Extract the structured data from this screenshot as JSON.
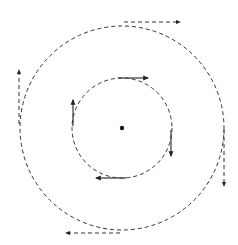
{
  "diagram": {
    "type": "concentric-circular-motion",
    "center": {
      "x": 122,
      "y": 128
    },
    "stroke_color": "#222222",
    "background": "#ffffff",
    "inner_circle": {
      "radius": 50,
      "style": "dashed"
    },
    "outer_circle": {
      "radius": 102,
      "style": "dashed"
    },
    "inner_arrows": [
      {
        "name": "top",
        "direction": "right",
        "style": "solid"
      },
      {
        "name": "right",
        "direction": "down",
        "style": "solid"
      },
      {
        "name": "bottom",
        "direction": "left",
        "style": "solid"
      },
      {
        "name": "left",
        "direction": "up",
        "style": "solid"
      }
    ],
    "outer_arrows": [
      {
        "name": "top",
        "direction": "right",
        "style": "dashed"
      },
      {
        "name": "right",
        "direction": "down",
        "style": "dashed"
      },
      {
        "name": "bottom",
        "direction": "left",
        "style": "dashed"
      },
      {
        "name": "left",
        "direction": "up",
        "style": "dashed"
      }
    ]
  }
}
